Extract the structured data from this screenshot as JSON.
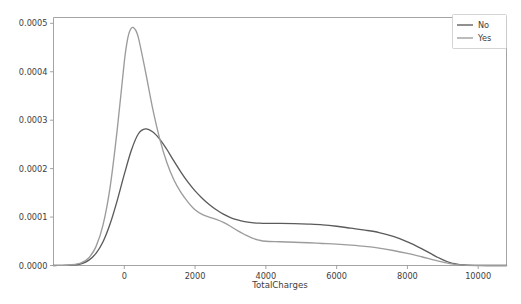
{
  "chart_data": {
    "type": "line",
    "title": "",
    "subtitle": "",
    "xlabel": "TotalCharges",
    "ylabel": "",
    "xlim": [
      -2000,
      10800
    ],
    "ylim": [
      0,
      0.000512
    ],
    "grid": false,
    "legend_position": "upper right",
    "xticks": [
      0,
      2000,
      4000,
      6000,
      8000,
      10000
    ],
    "xtick_labels": [
      "0",
      "2000",
      "4000",
      "6000",
      "8000",
      "10000"
    ],
    "yticks": [
      0.0,
      0.0001,
      0.0002,
      0.0003,
      0.0004,
      0.0005
    ],
    "ytick_labels": [
      "0.0000",
      "0.0001",
      "0.0002",
      "0.0003",
      "0.0004",
      "0.0005"
    ],
    "series": [
      {
        "name": "No",
        "color": "#5b5b5b",
        "x": [
          -2000,
          -1800,
          -1600,
          -1400,
          -1200,
          -1000,
          -800,
          -600,
          -400,
          -200,
          0,
          200,
          400,
          600,
          800,
          1000,
          1200,
          1400,
          1600,
          1800,
          2000,
          2200,
          2400,
          2600,
          2800,
          3000,
          3200,
          3400,
          3600,
          3800,
          4000,
          4400,
          4800,
          5200,
          5600,
          6000,
          6400,
          6800,
          7200,
          7600,
          8000,
          8400,
          8800,
          9200,
          9600,
          10000,
          10400,
          10800
        ],
        "y": [
          0.0,
          2e-07,
          5e-07,
          1.4e-06,
          4e-06,
          1.1e-05,
          2.5e-05,
          4.9e-05,
          8.6e-05,
          0.000134,
          0.000188,
          0.000238,
          0.000272,
          0.000282,
          0.000276,
          0.000261,
          0.00024,
          0.000216,
          0.000193,
          0.000172,
          0.000154,
          0.000139,
          0.000126,
          0.000115,
          0.000106,
          9.9e-05,
          9.4e-05,
          9.05e-05,
          8.85e-05,
          8.75e-05,
          8.7e-05,
          8.7e-05,
          8.65e-05,
          8.55e-05,
          8.4e-05,
          8.1e-05,
          7.7e-05,
          7.3e-05,
          6.8e-05,
          6e-05,
          4.9e-05,
          3.5e-05,
          1.9e-05,
          6e-06,
          1e-06,
          1e-07,
          0.0,
          0.0
        ]
      },
      {
        "name": "Yes",
        "color": "#9c9c9c",
        "x": [
          -2000,
          -1800,
          -1600,
          -1400,
          -1200,
          -1000,
          -800,
          -600,
          -400,
          -200,
          0,
          100,
          200,
          300,
          400,
          600,
          800,
          1000,
          1200,
          1400,
          1600,
          1800,
          2000,
          2200,
          2400,
          2600,
          2800,
          3000,
          3200,
          3400,
          3600,
          3800,
          4000,
          4400,
          4800,
          5200,
          5600,
          6000,
          6400,
          6800,
          7200,
          7600,
          8000,
          8400,
          8800,
          9200,
          9600,
          10000,
          10400,
          10800
        ],
        "y": [
          0.0,
          2e-07,
          6e-07,
          2e-06,
          6e-06,
          1.6e-05,
          3.9e-05,
          8.4e-05,
          0.000162,
          0.00028,
          0.00042,
          0.00047,
          0.00049,
          0.000488,
          0.00047,
          0.0004,
          0.000325,
          0.000262,
          0.000213,
          0.000177,
          0.000151,
          0.000131,
          0.000115,
          0.0001055,
          0.0001,
          9.5e-05,
          8.9e-05,
          8.1e-05,
          7.2e-05,
          6.4e-05,
          5.7e-05,
          5.25e-05,
          5e-05,
          4.9e-05,
          4.8e-05,
          4.7e-05,
          4.55e-05,
          4.4e-05,
          4.2e-05,
          3.95e-05,
          3.6e-05,
          3.1e-05,
          2.5e-05,
          1.8e-05,
          1.05e-05,
          4e-06,
          8e-07,
          0.0,
          0.0,
          0.0
        ]
      }
    ]
  },
  "legend": {
    "entries": [
      {
        "label": "No",
        "color": "#5b5b5b"
      },
      {
        "label": "Yes",
        "color": "#9c9c9c"
      }
    ]
  },
  "axes": {
    "x_label": "TotalCharges"
  },
  "colors": {
    "background": "#ffffff",
    "spine": "#9a9a9a",
    "text": "#3d3d3d",
    "series_no": "#5b5b5b",
    "series_yes": "#9c9c9c"
  }
}
